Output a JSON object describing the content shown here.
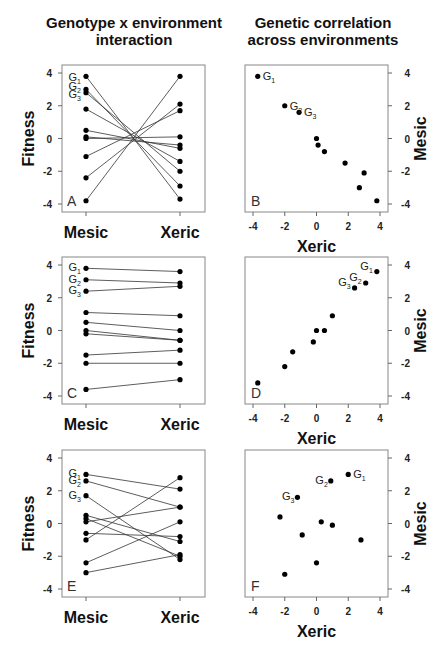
{
  "titles": {
    "left": [
      "Genotype x environment",
      "interaction"
    ],
    "right": [
      "Genetic correlation",
      "across environments"
    ]
  },
  "labels": {
    "fitness": "Fitness",
    "mesic": "Mesic",
    "xeric": "Xeric",
    "genotypes": [
      "G",
      "G",
      "G"
    ],
    "genotype_subscripts": [
      "1",
      "2",
      "3"
    ]
  },
  "ticks": [
    "4",
    "2",
    "0",
    "-2",
    "-4"
  ],
  "xticks": [
    "-4",
    "-2",
    "0",
    "2",
    "4"
  ],
  "panel_letters": [
    "A",
    "B",
    "C",
    "D",
    "E",
    "F"
  ],
  "chart_data": [
    {
      "panel": "A",
      "type": "line",
      "title": "Genotype x environment interaction",
      "categories": [
        "Mesic",
        "Xeric"
      ],
      "ylabel": "Fitness",
      "ylim": [
        -4,
        4
      ],
      "series": [
        {
          "name": "G1",
          "values": [
            3.8,
            -3.7
          ]
        },
        {
          "name": "G2",
          "values": [
            3.0,
            -2.9
          ]
        },
        {
          "name": "G3",
          "values": [
            2.8,
            -2.0
          ]
        },
        {
          "name": "g4",
          "values": [
            1.8,
            -1.4
          ]
        },
        {
          "name": "g5",
          "values": [
            0.5,
            -0.6
          ]
        },
        {
          "name": "g6",
          "values": [
            0.1,
            -0.4
          ]
        },
        {
          "name": "g7",
          "values": [
            0.0,
            0.1
          ]
        },
        {
          "name": "g8",
          "values": [
            -1.1,
            1.7
          ]
        },
        {
          "name": "g9",
          "values": [
            -2.4,
            2.1
          ]
        },
        {
          "name": "g10",
          "values": [
            -3.8,
            3.8
          ]
        }
      ]
    },
    {
      "panel": "B",
      "type": "scatter",
      "title": "Genetic correlation across environments",
      "xlabel": "Xeric",
      "ylabel": "Mesic",
      "xlim": [
        -4,
        4
      ],
      "ylim": [
        -4,
        4
      ],
      "points": [
        {
          "label": "G1",
          "x": -3.7,
          "y": 3.8
        },
        {
          "label": "G2",
          "x": -2.0,
          "y": 2.0
        },
        {
          "label": "G3",
          "x": -1.1,
          "y": 1.6
        },
        {
          "x": 0.0,
          "y": 0.0
        },
        {
          "x": 0.1,
          "y": -0.4
        },
        {
          "x": 0.5,
          "y": -0.8
        },
        {
          "x": 1.8,
          "y": -1.5
        },
        {
          "x": 3.0,
          "y": -2.1
        },
        {
          "x": 2.7,
          "y": -3.0
        },
        {
          "x": 3.8,
          "y": -3.8
        }
      ]
    },
    {
      "panel": "C",
      "type": "line",
      "categories": [
        "Mesic",
        "Xeric"
      ],
      "ylabel": "Fitness",
      "ylim": [
        -4,
        4
      ],
      "series": [
        {
          "name": "G1",
          "values": [
            3.8,
            3.6
          ]
        },
        {
          "name": "G2",
          "values": [
            3.1,
            2.9
          ]
        },
        {
          "name": "G3",
          "values": [
            2.4,
            2.7
          ]
        },
        {
          "name": "g4",
          "values": [
            1.1,
            0.9
          ]
        },
        {
          "name": "g5",
          "values": [
            0.5,
            0.0
          ]
        },
        {
          "name": "g6",
          "values": [
            0.0,
            -0.6
          ]
        },
        {
          "name": "g7",
          "values": [
            -0.2,
            -0.6
          ]
        },
        {
          "name": "g8",
          "values": [
            -1.5,
            -1.2
          ]
        },
        {
          "name": "g9",
          "values": [
            -2.0,
            -2.0
          ]
        },
        {
          "name": "g10",
          "values": [
            -3.6,
            -3.0
          ]
        }
      ]
    },
    {
      "panel": "D",
      "type": "scatter",
      "xlabel": "Xeric",
      "ylabel": "Mesic",
      "xlim": [
        -4,
        4
      ],
      "ylim": [
        -4,
        4
      ],
      "points": [
        {
          "label": "G1",
          "x": 3.8,
          "y": 3.6
        },
        {
          "label": "G2",
          "x": 3.1,
          "y": 2.9
        },
        {
          "label": "G3",
          "x": 2.4,
          "y": 2.6
        },
        {
          "x": 1.0,
          "y": 0.9
        },
        {
          "x": 0.0,
          "y": 0.0
        },
        {
          "x": 0.5,
          "y": 0.0
        },
        {
          "x": -0.2,
          "y": -0.7
        },
        {
          "x": -1.5,
          "y": -1.3
        },
        {
          "x": -2.0,
          "y": -2.2
        },
        {
          "x": -3.7,
          "y": -3.2
        }
      ]
    },
    {
      "panel": "E",
      "type": "line",
      "categories": [
        "Mesic",
        "Xeric"
      ],
      "ylabel": "Fitness",
      "xlabel": "",
      "ylim": [
        -4,
        4
      ],
      "series": [
        {
          "name": "G1",
          "values": [
            3.0,
            2.1
          ]
        },
        {
          "name": "G2",
          "values": [
            2.6,
            1.0
          ]
        },
        {
          "name": "G3",
          "values": [
            1.7,
            -2.2
          ]
        },
        {
          "name": "g4",
          "values": [
            0.5,
            -1.1
          ]
        },
        {
          "name": "g5",
          "values": [
            0.3,
            -2.0
          ]
        },
        {
          "name": "g6",
          "values": [
            0.1,
            1.0
          ]
        },
        {
          "name": "g7",
          "values": [
            -0.6,
            -0.8
          ]
        },
        {
          "name": "g8",
          "values": [
            -1.0,
            2.8
          ]
        },
        {
          "name": "g9",
          "values": [
            -2.4,
            0.1
          ]
        },
        {
          "name": "g10",
          "values": [
            -3.0,
            -1.9
          ]
        }
      ]
    },
    {
      "panel": "F",
      "type": "scatter",
      "xlabel": "Xeric",
      "ylabel": "Mesic",
      "xlim": [
        -4,
        4
      ],
      "ylim": [
        -4,
        4
      ],
      "points": [
        {
          "label": "G1",
          "x": 2.0,
          "y": 3.0
        },
        {
          "label": "G2",
          "x": 0.9,
          "y": 2.6
        },
        {
          "label": "G3",
          "x": -1.2,
          "y": 1.6
        },
        {
          "x": -2.3,
          "y": 0.4
        },
        {
          "x": 0.3,
          "y": 0.1
        },
        {
          "x": 1.0,
          "y": -0.1
        },
        {
          "x": -0.9,
          "y": -0.7
        },
        {
          "x": 2.8,
          "y": -1.0
        },
        {
          "x": 0.0,
          "y": -2.4
        },
        {
          "x": -2.0,
          "y": -3.1
        }
      ]
    }
  ]
}
